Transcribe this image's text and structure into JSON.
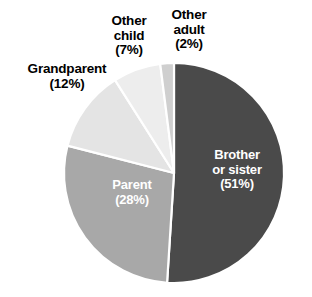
{
  "chart_data": {
    "type": "pie",
    "title": "",
    "subtitle": "",
    "xlabel": "",
    "ylabel": "",
    "legend_position": "none",
    "grid": false,
    "start_angle_deg": 0,
    "direction": "clockwise",
    "units": "percent",
    "categories": [
      "Brother or sister",
      "Parent",
      "Grandparent",
      "Other child",
      "Other adult"
    ],
    "values": [
      51,
      28,
      12,
      7,
      2
    ],
    "slices": [
      {
        "name": "Brother or sister",
        "label_line1": "Brother",
        "label_line2": "or sister",
        "value": 51,
        "value_text": "(51%)",
        "color": "#4a4a4a",
        "label_placement": "inside",
        "label_color": "#ffffff"
      },
      {
        "name": "Parent",
        "label_line1": "Parent",
        "label_line2": "",
        "value": 28,
        "value_text": "(28%)",
        "color": "#a8a8a8",
        "label_placement": "inside",
        "label_color": "#ffffff"
      },
      {
        "name": "Grandparent",
        "label_line1": "Grandparent",
        "label_line2": "",
        "value": 12,
        "value_text": "(12%)",
        "color": "#e4e4e4",
        "label_placement": "outside",
        "label_color": "#000000"
      },
      {
        "name": "Other child",
        "label_line1": "Other",
        "label_line2": "child",
        "value": 7,
        "value_text": "(7%)",
        "color": "#ededed",
        "label_placement": "outside",
        "label_color": "#000000"
      },
      {
        "name": "Other adult",
        "label_line1": "Other",
        "label_line2": "adult",
        "value": 2,
        "value_text": "(2%)",
        "color": "#cfcfcf",
        "label_placement": "outside",
        "label_color": "#000000"
      }
    ],
    "separator_color": "#ffffff",
    "background_color": "#ffffff"
  },
  "labels": {
    "brother_or_sister": "Brother\nor sister\n(51%)",
    "parent": "Parent\n(28%)",
    "grandparent": "Grandparent\n(12%)",
    "other_child": "Other\nchild\n(7%)",
    "other_adult": "Other\nadult\n(2%)"
  }
}
